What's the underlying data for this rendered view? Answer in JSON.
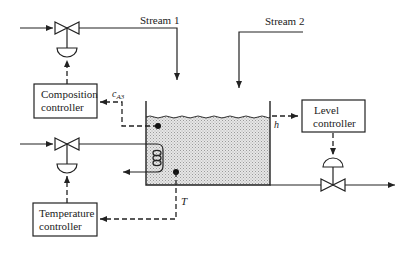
{
  "diagram": {
    "type": "process control schematic",
    "streams": [
      {
        "id": "stream1",
        "label": "Stream 1"
      },
      {
        "id": "stream2",
        "label": "Stream 2"
      }
    ],
    "controllers": [
      {
        "id": "composition",
        "line1": "Composition",
        "line2": "controller"
      },
      {
        "id": "temperature",
        "line1": "Temperature",
        "line2": "controller"
      },
      {
        "id": "level",
        "line1": "Level",
        "line2": "controller"
      }
    ],
    "measurements": {
      "composition": {
        "symbol": "c",
        "subscript": "A3"
      },
      "level": "h",
      "temperature": "T"
    },
    "colors": {
      "line": "#222222",
      "liquid_fill": "#d8d8d8",
      "background": "#ffffff"
    }
  }
}
